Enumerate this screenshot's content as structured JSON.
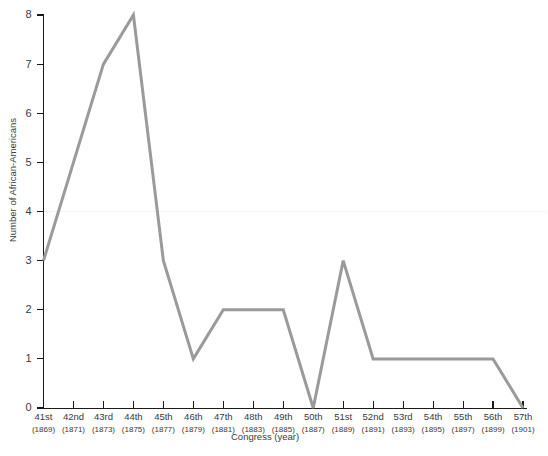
{
  "chart_data": {
    "type": "line",
    "title": "",
    "xlabel": "Congress (year)",
    "ylabel": "Number of African-Americans",
    "categories": [
      "41st",
      "42nd",
      "43rd",
      "44th",
      "45th",
      "46th",
      "47th",
      "48th",
      "49th",
      "50th",
      "51st",
      "52nd",
      "53rd",
      "54th",
      "55th",
      "56th",
      "57th"
    ],
    "category_sublabels": [
      "(1869)",
      "(1871)",
      "(1873)",
      "(1875)",
      "(1877)",
      "(1879)",
      "(1881)",
      "(1883)",
      "(1885)",
      "(1887)",
      "(1889)",
      "(1891)",
      "(1893)",
      "(1895)",
      "(1897)",
      "(1899)",
      "(1901)"
    ],
    "values": [
      3,
      5,
      7,
      8,
      3,
      1,
      2,
      2,
      2,
      0,
      3,
      1,
      1,
      1,
      1,
      1,
      0
    ],
    "ylim": [
      0,
      8
    ],
    "ytick_labels": [
      "0",
      "1",
      "2",
      "3",
      "4",
      "5",
      "6",
      "7",
      "8"
    ],
    "ytick_values": [
      0,
      1,
      2,
      3,
      4,
      5,
      6,
      7,
      8
    ],
    "grid": false,
    "legend": "none",
    "series_color": "#9a9a9a",
    "axis_color": "#1a1a1a"
  }
}
